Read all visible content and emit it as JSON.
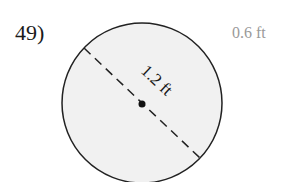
{
  "problem": {
    "number": "49)",
    "answer": "0.6 ft"
  },
  "diagram": {
    "shape": "circle",
    "fill": "#f1f1f1",
    "stroke": "#222222",
    "diameter_label": "1.2 ft",
    "center_point": true,
    "diameter_style": "dashed"
  }
}
